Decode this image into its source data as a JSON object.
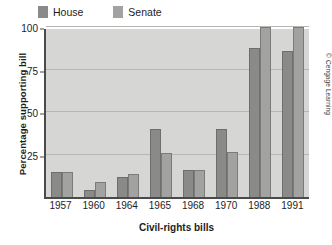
{
  "legend": {
    "position": "top-left",
    "items": [
      {
        "label": "House",
        "color": "#8a8a88"
      },
      {
        "label": "Senate",
        "color": "#a2a2a0"
      }
    ]
  },
  "credit": "© Cengage Learning",
  "chart_data": {
    "type": "bar",
    "title": "",
    "xlabel": "Civil-rights bills",
    "ylabel": "Percentage supporting bill",
    "categories": [
      "1957",
      "1960",
      "1964",
      "1965",
      "1968",
      "1970",
      "1988",
      "1991"
    ],
    "series": [
      {
        "name": "House",
        "color": "#8a8a88",
        "values": [
          15,
          4,
          12,
          40,
          16,
          40,
          87.5,
          86
        ]
      },
      {
        "name": "Senate",
        "color": "#a2a2a0",
        "values": [
          15,
          9,
          13.5,
          26,
          16,
          26.5,
          100,
          100
        ]
      }
    ],
    "ylim": [
      0,
      100
    ],
    "yticks": [
      0,
      25,
      50,
      75,
      100
    ],
    "ytick_labels": [
      "",
      "25",
      "50",
      "75",
      "100"
    ],
    "grid": true,
    "plot_background": "#d6d6d4"
  }
}
